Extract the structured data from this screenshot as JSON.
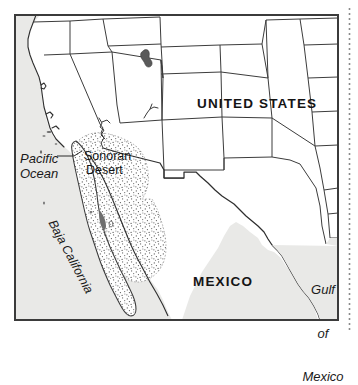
{
  "figure": {
    "type": "reference-map",
    "frame": {
      "border_color": "#3b3b3b",
      "background_color": "#e9e9e7",
      "land_color": "#ffffff"
    },
    "margin_rule": {
      "name": "page-margin-dotted-rule",
      "style": "dotted",
      "color": "#8a8a8a",
      "orientation": "vertical"
    }
  },
  "labels": {
    "united_states": "UNITED STATES",
    "mexico": "MEXICO",
    "pacific_ocean_line1": "Pacific",
    "pacific_ocean_line2": "Ocean",
    "sonoran_line1": "Sonoran",
    "sonoran_line2": "Desert",
    "baja_california": "Baja California",
    "gulf_line1": "Gulf",
    "gulf_line2": "of",
    "gulf_line3": "Mexico"
  },
  "map_features": {
    "countries": [
      "UNITED STATES",
      "MEXICO"
    ],
    "water_bodies": [
      "Pacific Ocean",
      "Gulf of Mexico",
      "Gulf of California",
      "Great Salt Lake"
    ],
    "regions": [
      "Sonoran Desert",
      "Baja California"
    ],
    "stippled_area": "Sonoran Desert",
    "state_boundaries_shown": true,
    "international_boundary_shown": true
  },
  "colors": {
    "ink": "#1d1d1d",
    "boundary_line": "#3c3c3c",
    "coastline": "#2e2e2e",
    "ocean_fill": "#e9e9e7",
    "stipple": "#5a5a5a",
    "frame": "#3b3b3b"
  }
}
